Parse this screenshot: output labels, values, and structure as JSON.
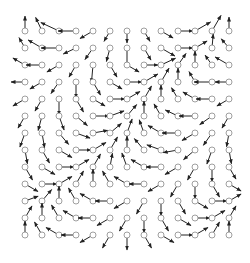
{
  "diagram": {
    "type": "vector-field",
    "grid": {
      "cols": 13,
      "rows": 13,
      "x0": 25,
      "y0": 31,
      "step": 17
    },
    "style": {
      "stroke": "#222222",
      "circle_stroke": "#888888",
      "circle_radius": 3
    },
    "angles": [
      [
        90,
        115,
        155,
        180,
        210,
        240,
        270,
        300,
        330,
        0,
        30,
        60,
        90
      ],
      [
        120,
        150,
        180,
        205,
        235,
        255,
        270,
        300,
        330,
        0,
        30,
        85,
        130
      ],
      [
        150,
        180,
        210,
        240,
        265,
        300,
        330,
        0,
        25,
        55,
        90,
        125,
        150
      ],
      [
        180,
        210,
        235,
        270,
        300,
        330,
        0,
        30,
        60,
        90,
        120,
        180,
        180
      ],
      [
        210,
        240,
        270,
        300,
        330,
        0,
        30,
        60,
        90,
        120,
        150,
        180,
        210
      ],
      [
        240,
        255,
        290,
        320,
        0,
        20,
        50,
        90,
        120,
        155,
        180,
        215,
        240
      ],
      [
        250,
        280,
        310,
        340,
        10,
        40,
        70,
        110,
        150,
        180,
        210,
        235,
        260
      ],
      [
        280,
        300,
        330,
        0,
        30,
        60,
        90,
        130,
        160,
        190,
        220,
        250,
        280
      ],
      [
        300,
        330,
        0,
        30,
        60,
        80,
        110,
        150,
        180,
        210,
        240,
        270,
        300
      ],
      [
        330,
        0,
        30,
        60,
        90,
        120,
        150,
        180,
        210,
        240,
        270,
        300,
        330
      ],
      [
        20,
        50,
        90,
        120,
        150,
        180,
        210,
        240,
        270,
        300,
        330,
        0,
        30
      ],
      [
        60,
        90,
        120,
        150,
        180,
        210,
        240,
        270,
        300,
        330,
        0,
        30,
        60
      ],
      [
        90,
        120,
        150,
        180,
        210,
        240,
        270,
        300,
        330,
        0,
        30,
        60,
        90
      ]
    ],
    "lengths": [
      [
        15,
        15,
        20,
        18,
        15,
        12,
        12,
        12,
        14,
        15,
        18,
        18,
        14
      ],
      [
        12,
        16,
        18,
        14,
        14,
        14,
        18,
        14,
        16,
        15,
        14,
        14,
        12
      ],
      [
        14,
        16,
        14,
        14,
        18,
        14,
        14,
        14,
        16,
        14,
        14,
        12,
        16
      ],
      [
        14,
        14,
        14,
        16,
        15,
        14,
        15,
        16,
        16,
        14,
        12,
        18,
        14
      ],
      [
        14,
        14,
        16,
        15,
        14,
        15,
        15,
        15,
        14,
        13,
        14,
        16,
        14
      ],
      [
        14,
        15,
        15,
        15,
        16,
        15,
        15,
        15,
        14,
        14,
        16,
        15,
        14
      ],
      [
        15,
        15,
        15,
        15,
        15,
        15,
        15,
        14,
        15,
        16,
        15,
        15,
        14
      ],
      [
        14,
        15,
        15,
        15,
        15,
        15,
        14,
        15,
        15,
        15,
        15,
        15,
        14
      ],
      [
        15,
        15,
        15,
        15,
        15,
        14,
        15,
        15,
        15,
        15,
        15,
        15,
        14
      ],
      [
        15,
        15,
        15,
        15,
        15,
        15,
        15,
        15,
        15,
        15,
        15,
        15,
        14
      ],
      [
        14,
        15,
        15,
        15,
        15,
        15,
        15,
        15,
        15,
        15,
        15,
        15,
        14
      ],
      [
        14,
        15,
        15,
        15,
        15,
        15,
        15,
        15,
        15,
        15,
        15,
        15,
        14
      ],
      [
        14,
        15,
        15,
        15,
        15,
        15,
        15,
        15,
        15,
        15,
        15,
        15,
        14
      ]
    ]
  }
}
